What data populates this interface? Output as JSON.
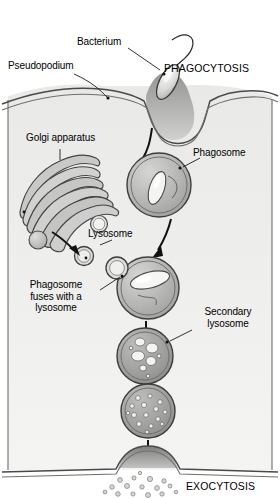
{
  "figure": {
    "type": "biological-process-diagram",
    "width": 280,
    "height": 499,
    "background_color": "#ffffff",
    "panel_color": "#f1f1f0",
    "ink_color": "#1a1a1a"
  },
  "labels": {
    "bacterium": "Bacterium",
    "pseudopodium": "Pseudopodium",
    "phagocytosis": "PHAGOCYTOSIS",
    "golgi": "Golgi apparatus",
    "phagosome": "Phagosome",
    "lysosome": "Lysosome",
    "fusion": "Phagosome\nfuses with a\nlysosome",
    "secondary_lysosome": "Secondary\nlysosome",
    "exocytosis": "EXOCYTOSIS"
  },
  "stages": [
    {
      "id": "engulfment",
      "label": "Pseudopodium",
      "description": "Pseudopodia extend around bacterium at cell surface"
    },
    {
      "id": "phagosome",
      "label": "Phagosome",
      "description": "Internalized vesicle containing intact bacterium"
    },
    {
      "id": "fusion",
      "label": "Phagosome fuses with a lysosome",
      "description": "Lysosome merges with phagosome membrane"
    },
    {
      "id": "secondary-lysosome",
      "label": "Secondary lysosome",
      "description": "Bacterium partially digested into fragments"
    },
    {
      "id": "residual-body",
      "label": "",
      "description": "Contents fully digested into small particles"
    },
    {
      "id": "exocytosis",
      "label": "EXOCYTOSIS",
      "description": "Residue expelled through plasma membrane"
    }
  ],
  "organelles": [
    {
      "name": "Golgi apparatus",
      "role": "produces lysosomes"
    },
    {
      "name": "Lysosome",
      "role": "supplies digestive enzymes"
    }
  ]
}
